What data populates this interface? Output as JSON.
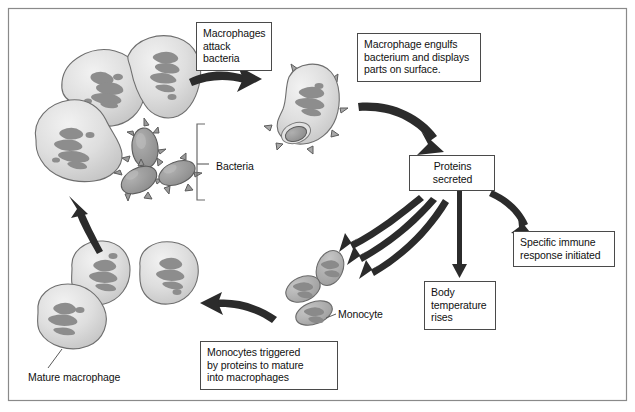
{
  "diagram": {
    "frame_border_color": "#8a8a8a",
    "background": "#ffffff",
    "cell_fill": "#dcdcdc",
    "cell_stroke": "#6e6e6e",
    "nucleus_fill": "#8c8c8c",
    "arrow_color": "#2b2b2b",
    "text_color": "#111111",
    "box_border_color": "#4a4a4a"
  },
  "callouts": {
    "macrophages_attack": "Macrophages\nattack\nbacteria",
    "macrophage_engulfs": "Macrophage engulfs\nbacterium and displays\nparts on surface.",
    "proteins_secreted": "Proteins\nsecreted",
    "specific_immune": "Specific immune\nresponse initiated",
    "body_temperature": "Body\ntemperature\nrises",
    "monocytes_triggered": "Monocytes triggered\nby proteins to mature\ninto macrophages"
  },
  "labels": {
    "bacteria": "Bacteria",
    "monocyte": "Monocyte",
    "mature_macrophage": "Mature macrophage"
  },
  "structures": {
    "macrophage_cluster_top": {
      "name": "macrophage-cluster-attacking",
      "count": 3
    },
    "bacteria_cluster": {
      "name": "spiky-bacteria-cluster",
      "count": 4
    },
    "antigen_presenting_macrophage": {
      "name": "macrophage-with-engulfed-bacterium",
      "count": 1
    },
    "monocyte_cluster": {
      "name": "monocyte-cluster",
      "count": 3
    },
    "macrophage_cluster_bottom": {
      "name": "mature-macrophage-cluster",
      "count": 3
    }
  },
  "arrows": [
    {
      "name": "arrow-attack-to-engulf",
      "from": "macrophage-cluster-attacking",
      "to": "antigen-presenting-macrophage",
      "style": "thick-curved-right"
    },
    {
      "name": "arrow-engulf-to-proteins",
      "from": "antigen-presenting-macrophage",
      "to": "proteins-secreted-box",
      "style": "thick-curved-down-right"
    },
    {
      "name": "arrow-proteins-to-specific-immune",
      "from": "proteins-secreted-box",
      "to": "specific-immune-box",
      "style": "thick-curved-down-right"
    },
    {
      "name": "arrow-proteins-to-body-temp",
      "from": "proteins-secreted-box",
      "to": "body-temperature-box",
      "style": "straight-down"
    },
    {
      "name": "arrow-proteins-to-monocytes-1",
      "from": "proteins-secreted-box",
      "to": "monocyte-cluster",
      "style": "thin-curved-down-left"
    },
    {
      "name": "arrow-proteins-to-monocytes-2",
      "from": "proteins-secreted-box",
      "to": "monocyte-cluster",
      "style": "thin-curved-down-left"
    },
    {
      "name": "arrow-proteins-to-monocytes-3",
      "from": "proteins-secreted-box",
      "to": "monocyte-cluster",
      "style": "thin-curved-down-left"
    },
    {
      "name": "arrow-monocytes-to-macrophages",
      "from": "monocyte-cluster",
      "to": "mature-macrophage-cluster",
      "style": "thick-curved-left"
    },
    {
      "name": "arrow-macrophages-to-attack",
      "from": "mature-macrophage-cluster",
      "to": "macrophage-cluster-attacking",
      "style": "thick-curved-up"
    }
  ]
}
